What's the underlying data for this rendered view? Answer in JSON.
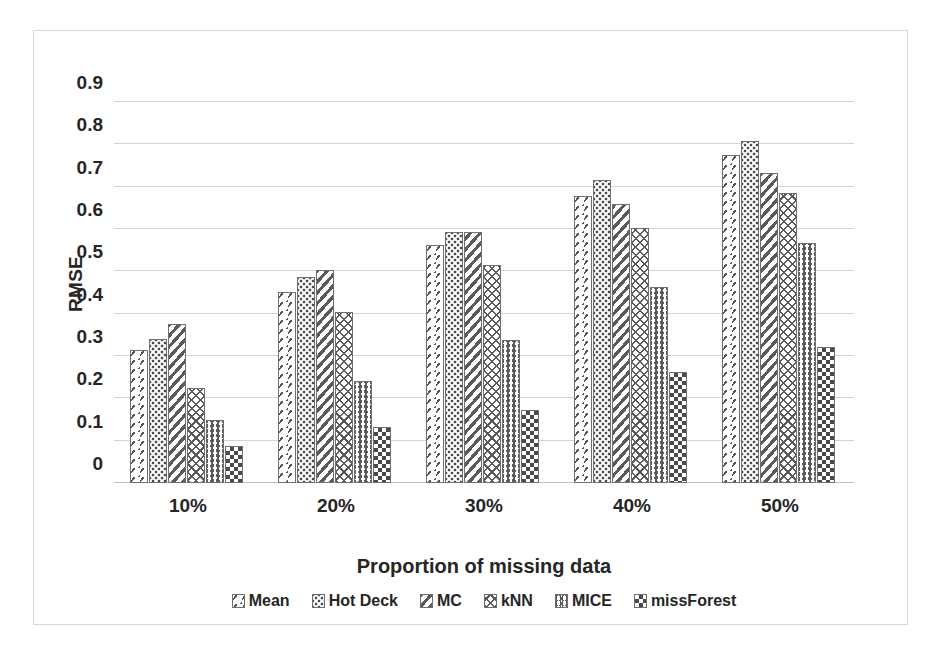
{
  "chart_data": {
    "type": "bar",
    "title": "",
    "xlabel": "Proportion of missing data",
    "ylabel": "RMSE",
    "categories": [
      "10%",
      "20%",
      "30%",
      "40%",
      "50%"
    ],
    "ylim": [
      0,
      0.9
    ],
    "yticks": [
      "0",
      "0.1",
      "0.2",
      "0.3",
      "0.4",
      "0.5",
      "0.6",
      "0.7",
      "0.8",
      "0.9"
    ],
    "ytick_values": [
      0,
      0.1,
      0.2,
      0.3,
      0.4,
      0.5,
      0.6,
      0.7,
      0.8,
      0.9
    ],
    "grid": true,
    "legend_position": "bottom",
    "series": [
      {
        "name": "Mean",
        "pattern": "diagonal-dashes",
        "values": [
          0.315,
          0.452,
          0.562,
          0.678,
          0.775
        ]
      },
      {
        "name": "Hot Deck",
        "pattern": "dots",
        "values": [
          0.34,
          0.487,
          0.593,
          0.715,
          0.808
        ]
      },
      {
        "name": "MC",
        "pattern": "wide-diagonal",
        "values": [
          0.375,
          0.503,
          0.592,
          0.66,
          0.732
        ]
      },
      {
        "name": "kNN",
        "pattern": "diamond-crosshatch",
        "values": [
          0.225,
          0.403,
          0.515,
          0.603,
          0.685
        ]
      },
      {
        "name": "MICE",
        "pattern": "chevron",
        "values": [
          0.148,
          0.242,
          0.337,
          0.462,
          0.567
        ]
      },
      {
        "name": "missForest",
        "pattern": "checkerboard",
        "values": [
          0.088,
          0.133,
          0.173,
          0.263,
          0.322
        ]
      }
    ]
  },
  "colors": {
    "hatch": "#5a5a5a",
    "bar_outline": "#6f6f6f",
    "gridline": "#d3d3d3",
    "text": "#262626",
    "frame_border": "#d8d8d8",
    "background": "#ffffff"
  }
}
